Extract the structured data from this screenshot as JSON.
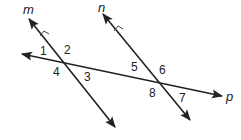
{
  "diagram": {
    "lines": [
      {
        "name": "m",
        "label": "m",
        "parallel_mark": true
      },
      {
        "name": "n",
        "label": "n",
        "parallel_mark": true
      },
      {
        "name": "p",
        "label": "p",
        "parallel_mark": false
      }
    ],
    "angles": {
      "a1": "1",
      "a2": "2",
      "a3": "3",
      "a4": "4",
      "a5": "5",
      "a6": "6",
      "a7": "7",
      "a8": "8"
    },
    "colors": {
      "stroke": "#222222",
      "background": "#ffffff"
    }
  }
}
